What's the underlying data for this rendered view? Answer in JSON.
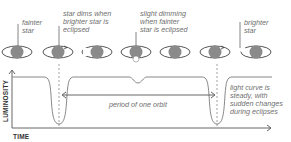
{
  "diagram": {
    "callouts": [
      {
        "id": "fainter",
        "text": "fainter\nstar",
        "x": 22,
        "y": 19
      },
      {
        "id": "dim-bright",
        "text": "star dims when\nbrighter star is\neclipsed",
        "x": 63,
        "y": 10
      },
      {
        "id": "dim-faint",
        "text": "slight dimming\nwhen fainter\nstar is eclipsed",
        "x": 140,
        "y": 10
      },
      {
        "id": "brighter",
        "text": "brighter\nstar",
        "x": 244,
        "y": 19
      }
    ],
    "period_label": "period of one orbit",
    "curve_note": "light curve is\nsteady, with\nsudden changes\nduring eclipses",
    "y_axis_label": "LUMINOSITY",
    "x_axis_label": "TIME",
    "colors": {
      "star_fill": "#8a8a8a",
      "orbit": "#555555",
      "curve": "#7a7a7a",
      "axis": "#555555",
      "text": "#6f6f6f"
    },
    "star_systems": [
      {
        "x": 17,
        "phase": "fainter-star-front-left"
      },
      {
        "x": 58,
        "phase": "primary-eclipse"
      },
      {
        "x": 97,
        "phase": "after-primary"
      },
      {
        "x": 136,
        "phase": "secondary-eclipse"
      },
      {
        "x": 175,
        "phase": "after-secondary"
      },
      {
        "x": 215,
        "phase": "approaching"
      },
      {
        "x": 256,
        "phase": "brighter-star-visible"
      }
    ]
  }
}
